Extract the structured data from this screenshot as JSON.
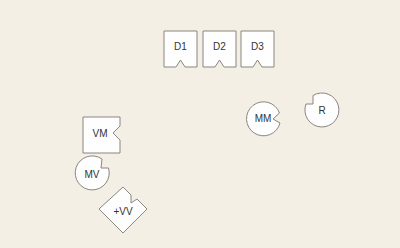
{
  "colors": {
    "background": "#f3efe5",
    "shape_fill": "#fefefe",
    "shape_stroke": "#8a8680",
    "label": "#333333"
  },
  "shapes": [
    {
      "id": "d1",
      "label": "D1",
      "kind": "notched-box",
      "notch": "bottom"
    },
    {
      "id": "d2",
      "label": "D2",
      "kind": "notched-box",
      "notch": "bottom"
    },
    {
      "id": "d3",
      "label": "D3",
      "kind": "notched-box",
      "notch": "bottom"
    },
    {
      "id": "vm",
      "label": "VM",
      "kind": "notched-box",
      "notch": "right"
    },
    {
      "id": "mm",
      "label": "MM",
      "kind": "notched-circle",
      "notch": "right"
    },
    {
      "id": "r",
      "label": "R",
      "kind": "notched-circle",
      "notch": "upper-left"
    },
    {
      "id": "mv",
      "label": "MV",
      "kind": "notched-circle",
      "notch": "upper-right"
    },
    {
      "id": "vv",
      "label": "+VV",
      "kind": "notched-diamond",
      "notch": "upper-right"
    }
  ]
}
